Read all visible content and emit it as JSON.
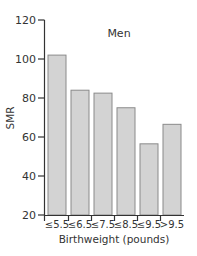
{
  "chart_data": {
    "type": "bar",
    "title": "Men",
    "xlabel": "Birthweight (pounds)",
    "ylabel": "SMR",
    "ylim": [
      20,
      120
    ],
    "yticks": [
      20,
      40,
      60,
      80,
      100,
      120
    ],
    "categories": [
      "≤5.5",
      "≤6.5",
      "≤7.5",
      "≤8.5",
      "≤9.5",
      ">9.5"
    ],
    "values": [
      102,
      84,
      82.5,
      75,
      56.5,
      66.5
    ],
    "grid": false,
    "legend": null,
    "bar_color": "#d3d3d3",
    "bar_edge_color": "#8a8a8a",
    "axis_color": "#333333"
  }
}
